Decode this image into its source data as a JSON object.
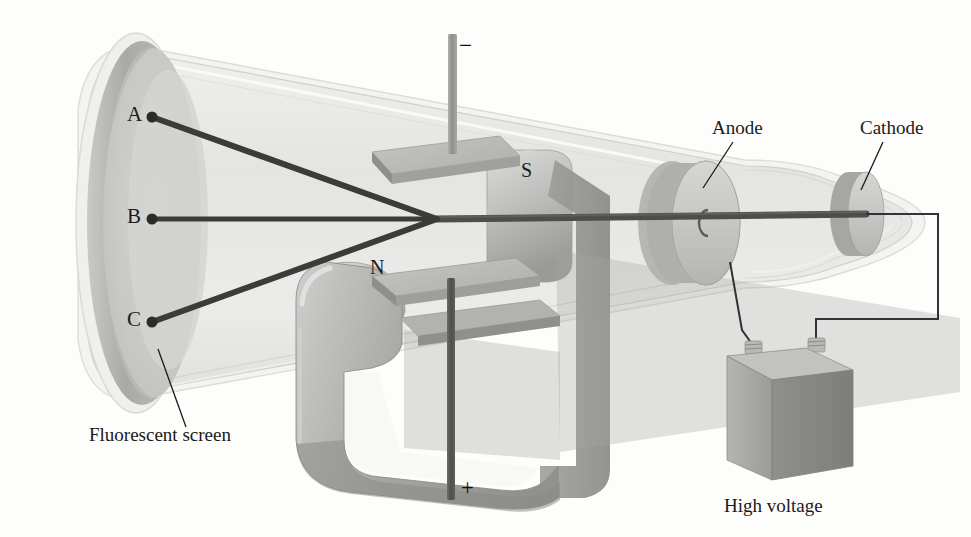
{
  "figure": {
    "background_color": "#fdfdfc",
    "ink_color": "#1a1a1a"
  },
  "labels": {
    "beam_spot_a": "A",
    "beam_spot_b": "B",
    "beam_spot_c": "C",
    "pole_north": "N",
    "pole_south": "S",
    "terminal_negative": "−",
    "terminal_positive": "+",
    "screen": "Fluorescent screen",
    "anode": "Anode",
    "cathode": "Cathode",
    "power_supply": "High voltage"
  },
  "colors": {
    "glass_fill": "#e8e8e6",
    "glass_edge": "#c9c9c7",
    "screen_face": "#c6c6c4",
    "screen_rim": "#b0b0ae",
    "screen_inner": "#d2d2d0",
    "electrode_light": "#cdcdcb",
    "electrode_dark": "#a8a8a6",
    "magnet_light": "#bdbdbb",
    "magnet_mid": "#a3a3a1",
    "magnet_dark": "#8e8e8c",
    "plate_top": "#bcbcba",
    "plate_side": "#9d9d9b",
    "beam": "#4a4a4a",
    "rod": "#9a9a98",
    "rod_dark": "#6d6d6b",
    "box_front": "#a9a9a7",
    "box_side": "#8d8d8b",
    "box_top": "#c2c2c0",
    "wire": "#3d3d3d"
  },
  "geometry": {
    "beam_converge_point": {
      "x": 437,
      "y": 219
    },
    "spot_a": {
      "x": 152,
      "y": 117
    },
    "spot_b": {
      "x": 152,
      "y": 219
    },
    "spot_c": {
      "x": 152,
      "y": 322
    },
    "anode_center": {
      "x": 702,
      "y": 222
    },
    "cathode_center": {
      "x": 865,
      "y": 212
    }
  }
}
